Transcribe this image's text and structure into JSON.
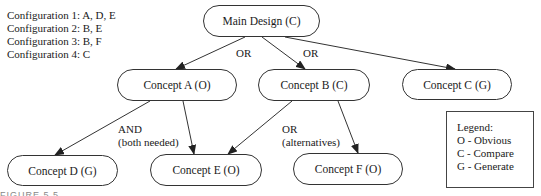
{
  "configurations": [
    "Configuration 1: A, D, E",
    "Configuration 2: B, E",
    "Configuration 3: B, F",
    "Configuration 4: C"
  ],
  "nodes": {
    "main": "Main Design (C)",
    "a": "Concept A (O)",
    "b": "Concept B (C)",
    "c": "Concept C (G)",
    "d": "Concept D (G)",
    "e": "Concept E (O)",
    "f": "Concept F (O)"
  },
  "edge_labels": {
    "main_a_or": "OR",
    "main_b_or": "OR",
    "a_and": "AND",
    "a_and_note": "(both needed)",
    "b_or": "OR",
    "b_or_note": "(alternatives)"
  },
  "legend": {
    "title": "Legend:",
    "items": [
      "O - Obvious",
      "C - Compare",
      "G - Generate"
    ]
  },
  "caption": "FIGURE 5.5",
  "colors": {
    "line": "#333333",
    "background": "#ffffff"
  }
}
